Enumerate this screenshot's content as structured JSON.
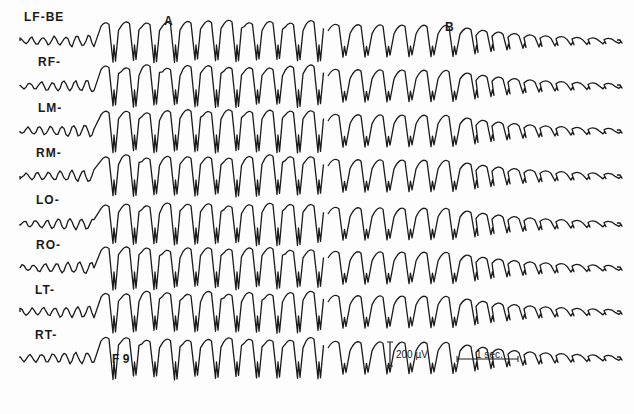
{
  "figure": {
    "segment_labels": {
      "a": "A",
      "b": "B"
    },
    "marker_label": "F 9",
    "calibration": {
      "amplitude": "200 µV",
      "time": "1 sec."
    },
    "channels": [
      {
        "label": "LF-BE",
        "y": 35
      },
      {
        "label": "RF-",
        "y": 80
      },
      {
        "label": "LM-",
        "y": 125
      },
      {
        "label": "RM-",
        "y": 170
      },
      {
        "label": "LO-",
        "y": 218
      },
      {
        "label": "RO-",
        "y": 262
      },
      {
        "label": "LT-",
        "y": 306
      },
      {
        "label": "RT-",
        "y": 352
      }
    ],
    "ink_color": "#1a1a1a"
  }
}
